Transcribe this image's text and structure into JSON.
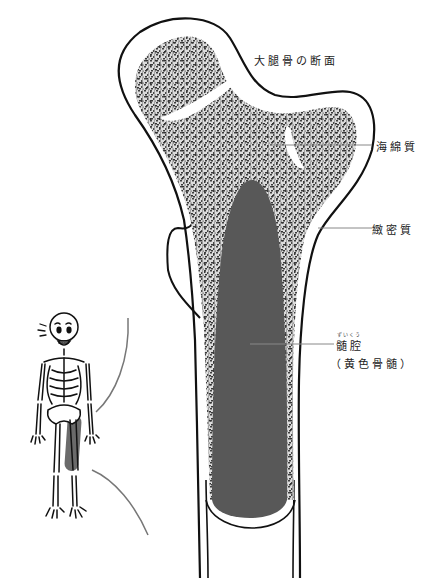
{
  "title": "大腿骨の断面",
  "labels": {
    "spongy_bone": "海綿質",
    "compact_bone": "緻密質",
    "marrow_cavity": "髄腔",
    "marrow_cavity_reading": "ずいくう",
    "yellow_marrow": "（黄色骨髄）"
  },
  "colors": {
    "outline": "#111111",
    "spongy_fill": "#d8d8d8",
    "spongy_dots": "#4a4a4a",
    "marrow_cavity": "#585858",
    "leader_line": "#888888",
    "highlight_leg": "#6a6a6a"
  },
  "icons": {
    "skeleton": "skeleton-figure-icon"
  }
}
